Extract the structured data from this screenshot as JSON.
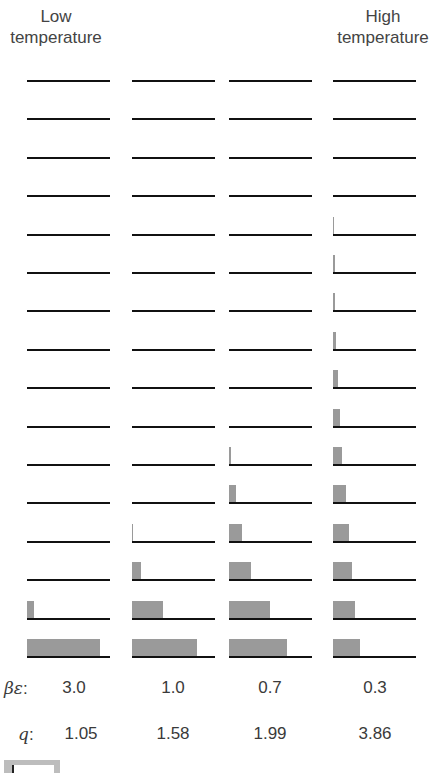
{
  "headers": {
    "low": [
      "Low",
      "temperature"
    ],
    "high": [
      "High",
      "temperature"
    ]
  },
  "row_labels": {
    "beta_epsilon_symbol": "βε",
    "q_symbol": "q"
  },
  "colors": {
    "level_line": "#111111",
    "occupancy_bar": "#9a9a9a",
    "text": "#3a3a3a"
  },
  "chart_data": {
    "type": "bar",
    "levels_per_column": 16,
    "level_index_order": "bottom-to-top (0 = ground state)",
    "columns": [
      {
        "label": "Low temperature",
        "beta_epsilon": "3.0",
        "q": "1.05",
        "bar_widths_px": [
          73,
          7,
          0,
          0,
          0,
          0,
          0,
          0,
          0,
          0,
          0,
          0,
          0,
          0,
          0,
          0
        ]
      },
      {
        "label": "",
        "beta_epsilon": "1.0",
        "q": "1.58",
        "bar_widths_px": [
          65,
          31,
          9,
          1,
          0,
          0,
          0,
          0,
          0,
          0,
          0,
          0,
          0,
          0,
          0,
          0
        ]
      },
      {
        "label": "",
        "beta_epsilon": "0.7",
        "q": "1.99",
        "bar_widths_px": [
          58,
          41,
          22,
          13,
          7,
          2,
          0,
          0,
          0,
          0,
          0,
          0,
          0,
          0,
          0,
          0
        ]
      },
      {
        "label": "High temperature",
        "beta_epsilon": "0.3",
        "q": "3.86",
        "bar_widths_px": [
          27,
          22,
          19,
          16,
          13,
          9,
          7,
          5,
          3,
          2,
          2,
          1,
          0,
          0,
          0,
          0
        ]
      }
    ],
    "row_labels": [
      "βε",
      "q"
    ],
    "beta_epsilon": [
      "3.0",
      "1.0",
      "0.7",
      "0.3"
    ],
    "q": [
      "1.05",
      "1.58",
      "1.99",
      "3.86"
    ],
    "xlabel": "",
    "ylabel": "",
    "grid": false,
    "legend": "none"
  }
}
